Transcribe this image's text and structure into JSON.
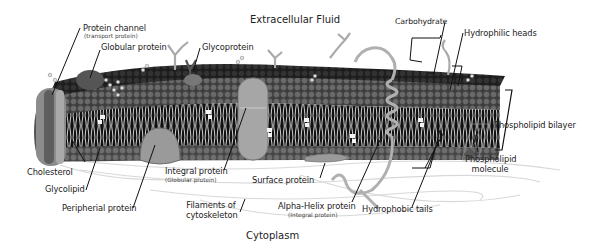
{
  "diagram": {
    "regions": {
      "extracellular": "Extracellular Fluid",
      "cytoplasm": "Cytoplasm"
    },
    "labels": {
      "protein_channel": "Protein channel",
      "protein_channel_sub": "(transport protein)",
      "globular_protein": "Globular protein",
      "glycoprotein": "Glycoprotein",
      "carbohydrate": "Carbohydrate",
      "hydrophilic_heads": "Hydrophilic heads",
      "phospholipid_bilayer": "Phospholipid bilayer",
      "phospholipid_molecule_1": "Phospholipid",
      "phospholipid_molecule_2": "molecule",
      "cholesterol": "Cholesterol",
      "glycolipid": "Glycolipid",
      "peripherial_protein": "Peripherial protein",
      "integral_protein": "Integral protein",
      "integral_protein_sub": "(Globular protein)",
      "surface_protein": "Surface protein",
      "filaments_1": "Filaments of",
      "filaments_2": "cytoskeleton",
      "alpha_helix": "Alpha-Helix protein",
      "alpha_helix_sub": "(Integral protein)",
      "hydrophobic_tails": "Hydrophobic tails"
    },
    "colors": {
      "head_dark": "#2a2a2a",
      "head_mid": "#5a5a5a",
      "head_light": "#7a7a7a",
      "tail": "#e8e8e8",
      "core": "#111111",
      "protein": "#9a9a9a",
      "protein_light": "#bdbdbd",
      "leader": "#111111"
    }
  }
}
